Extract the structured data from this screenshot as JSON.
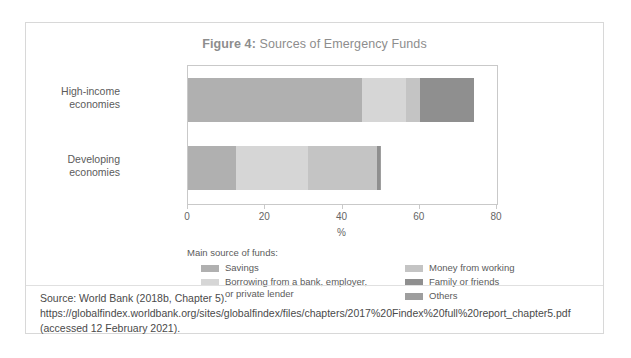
{
  "figure": {
    "title_prefix": "Figure 4:",
    "title_text": " Sources of Emergency Funds"
  },
  "source": {
    "text": "Source: World Bank (2018b, Chapter 5). https://globalfindex.worldbank.org/sites/globalfindex/files/chapters/2017%20Findex%20full%20report_chapter5.pdf (accessed 12 February 2021)."
  },
  "legend": {
    "title": "Main source of funds:",
    "left_items": [
      {
        "label": "Savings",
        "color": "#b0b0b0"
      },
      {
        "label": "Borrowing from a bank, employer,\nor private lender",
        "color": "#d6d6d6"
      }
    ],
    "right_items": [
      {
        "label": "Money from working",
        "color": "#c4c4c4"
      },
      {
        "label": "Family or friends",
        "color": "#8f8f8f"
      },
      {
        "label": "Others",
        "color": "#9e9e9e"
      }
    ]
  },
  "chart_data": {
    "type": "bar",
    "orientation": "horizontal",
    "stacked": true,
    "title": "Figure 4: Sources of Emergency Funds",
    "xlabel": "%",
    "ylabel": "",
    "xlim": [
      0,
      80
    ],
    "xticks": [
      0,
      20,
      40,
      60,
      80
    ],
    "xticklabels": [
      "0",
      "20",
      "40",
      "60",
      "80"
    ],
    "grid": false,
    "legend_position": "bottom",
    "categories": [
      "High-income\neconomies",
      "Developing\neconomies"
    ],
    "category_labels_flat": [
      "High-income economies",
      "Developing economies"
    ],
    "series": [
      {
        "name": "Savings",
        "color": "#b0b0b0",
        "values": [
          45.0,
          12.5
        ]
      },
      {
        "name": "Borrowing from a bank, employer, or private lender",
        "color": "#d6d6d6",
        "values": [
          11.5,
          18.5
        ]
      },
      {
        "name": "Money from working",
        "color": "#c4c4c4",
        "values": [
          3.5,
          18.0
        ]
      },
      {
        "name": "Family or friends",
        "color": "#8f8f8f",
        "values": [
          14.0,
          0.7
        ]
      },
      {
        "name": "Others",
        "color": "#9e9e9e",
        "values": [
          0.0,
          0.3
        ]
      }
    ],
    "totals": [
      74.0,
      50.0
    ]
  }
}
